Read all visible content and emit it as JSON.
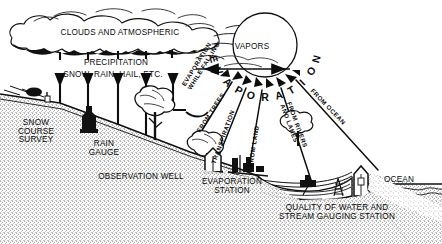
{
  "diagram": {
    "type": "schematic-illustration",
    "style": "black-and-white stippled line art",
    "background_color": "#ffffff",
    "ink_color": "#0a0a0a",
    "width": 442,
    "height": 244
  },
  "sky": {
    "cloud_label": "CLOUDS AND ATMOSPHERIC",
    "precipitation_label": "PRECIPITATION",
    "precipitation_types": "SNOW, RAIN, HAIL, ETC.",
    "vapors_label": "VAPORS",
    "arrow_count": 5,
    "arrow_direction": "down"
  },
  "sun": {
    "name": "sun-disc",
    "evaporation_arc_text": "EVAPORATION",
    "ray_count": 9
  },
  "evaporation_sources": [
    {
      "id": "while-falling",
      "label_line1": "EVAPORATION",
      "label_line2": "WHILE FALLING",
      "angle_deg": -58
    },
    {
      "id": "from-trees",
      "label_line1": "FROM TREES",
      "label_line2": "",
      "angle_deg": -42
    },
    {
      "id": "transpiration",
      "label_line1": "TRANSPIRATION",
      "label_line2": "",
      "angle_deg": -63
    },
    {
      "id": "from-land",
      "label_line1": "FROM LAND",
      "label_line2": "",
      "angle_deg": -78
    },
    {
      "id": "from-rivers-lakes",
      "label_line1": "FROM RIVERS",
      "label_line2": "AND LAKES",
      "angle_deg": 69
    },
    {
      "id": "from-ocean",
      "label_line1": "FROM OCEAN",
      "label_line2": "",
      "angle_deg": 45
    }
  ],
  "ground_stations": [
    {
      "id": "snow-course-survey",
      "lines": [
        "SNOW",
        "COURSE",
        "SURVEY"
      ]
    },
    {
      "id": "rain-gauge",
      "lines": [
        "RAIN",
        "GAUGE"
      ]
    },
    {
      "id": "observation-well",
      "lines": [
        "OBSERVATION WELL"
      ]
    },
    {
      "id": "evaporation-station",
      "lines": [
        "EVAPORATION",
        "STATION"
      ]
    },
    {
      "id": "stream-gauging-station",
      "lines": [
        "QUALITY OF WATER AND",
        "STREAM GAUGING STATION"
      ]
    },
    {
      "id": "ocean",
      "lines": [
        "OCEAN"
      ]
    }
  ],
  "scene_elements": {
    "trees": 3,
    "hill_slope": "descends left to right",
    "water_body": "river / estuary leading to ocean",
    "ocean_label": "OCEAN"
  }
}
